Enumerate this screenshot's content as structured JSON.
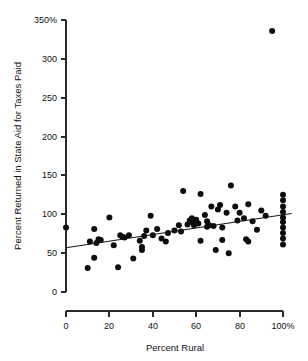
{
  "chart_data": {
    "type": "scatter",
    "title": "",
    "xlabel": "Percent Rural",
    "ylabel": "Percent Returned in State Aid for Taxes Paid",
    "xlim": [
      0,
      100
    ],
    "ylim": [
      0,
      350
    ],
    "grid": false,
    "legend": null,
    "x_ticks": [
      0,
      20,
      40,
      60,
      80,
      100
    ],
    "x_tick_labels": [
      "0",
      "20",
      "40",
      "60",
      "80",
      "100%"
    ],
    "y_ticks": [
      0,
      50,
      100,
      150,
      200,
      250,
      300,
      350
    ],
    "y_tick_labels": [
      "0",
      "50",
      "100",
      "150",
      "200",
      "250",
      "300",
      "350%"
    ],
    "marker": "filled-circle",
    "marker_color": "#0d0d0d",
    "marker_size_px": 3.0,
    "points": [
      [
        0,
        83
      ],
      [
        10,
        31
      ],
      [
        11,
        65
      ],
      [
        13,
        81
      ],
      [
        13,
        44
      ],
      [
        14,
        63
      ],
      [
        15,
        68
      ],
      [
        16,
        67
      ],
      [
        20,
        96
      ],
      [
        22,
        60
      ],
      [
        24,
        32
      ],
      [
        25,
        73
      ],
      [
        26,
        71
      ],
      [
        27,
        70
      ],
      [
        29,
        73
      ],
      [
        31,
        43
      ],
      [
        34,
        66
      ],
      [
        35,
        58
      ],
      [
        35,
        54
      ],
      [
        36,
        72
      ],
      [
        37,
        79
      ],
      [
        39,
        98
      ],
      [
        40,
        73
      ],
      [
        42,
        81
      ],
      [
        44,
        69
      ],
      [
        46,
        65
      ],
      [
        47,
        76
      ],
      [
        50,
        79
      ],
      [
        52,
        86
      ],
      [
        53,
        78
      ],
      [
        54,
        130
      ],
      [
        56,
        87
      ],
      [
        57,
        92
      ],
      [
        58,
        90
      ],
      [
        58,
        95
      ],
      [
        59,
        91
      ],
      [
        59,
        86
      ],
      [
        60,
        93
      ],
      [
        61,
        88
      ],
      [
        62,
        126
      ],
      [
        62,
        66
      ],
      [
        64,
        99
      ],
      [
        65,
        91
      ],
      [
        65,
        84
      ],
      [
        66,
        86
      ],
      [
        67,
        110
      ],
      [
        68,
        85
      ],
      [
        69,
        54
      ],
      [
        70,
        106
      ],
      [
        71,
        112
      ],
      [
        72,
        83
      ],
      [
        72,
        67
      ],
      [
        74,
        102
      ],
      [
        75,
        50
      ],
      [
        76,
        137
      ],
      [
        78,
        110
      ],
      [
        79,
        92
      ],
      [
        80,
        102
      ],
      [
        82,
        95
      ],
      [
        83,
        68
      ],
      [
        84,
        113
      ],
      [
        84,
        65
      ],
      [
        86,
        91
      ],
      [
        88,
        80
      ],
      [
        90,
        105
      ],
      [
        92,
        98
      ],
      [
        95,
        336
      ],
      [
        100,
        125
      ],
      [
        100,
        118
      ],
      [
        100,
        110
      ],
      [
        100,
        103
      ],
      [
        100,
        96
      ],
      [
        100,
        90
      ],
      [
        100,
        83
      ],
      [
        100,
        76
      ],
      [
        100,
        69
      ],
      [
        100,
        61
      ]
    ],
    "trend_line": {
      "type": "linear-fit",
      "x_start": 0,
      "y_start": 57,
      "x_end": 104,
      "y_end": 101
    },
    "outlier_note": "one point near (95, 336)"
  },
  "axes": {
    "x_title": "Percent Rural",
    "y_title": "Percent Returned in State Aid for Taxes Paid"
  }
}
